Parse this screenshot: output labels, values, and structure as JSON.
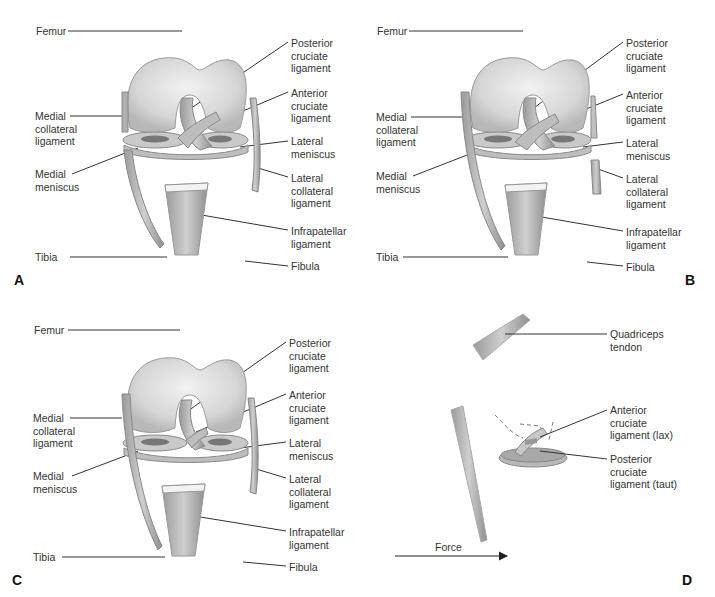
{
  "figure": {
    "panels": [
      {
        "id": "A",
        "letter": "A",
        "labels": {
          "femur": "Femur",
          "pcl": "Posterior\ncruciate\nligament",
          "acl": "Anterior\ncruciate\nligament",
          "mcl": "Medial\ncollateral\nligament",
          "lateral_meniscus": "Lateral\nmeniscus",
          "medial_meniscus": "Medial\nmeniscus",
          "lcl": "Lateral\ncollateral\nligament",
          "infrapatellar": "Infrapatellar\nligament",
          "tibia": "Tibia",
          "fibula": "Fibula"
        }
      },
      {
        "id": "B",
        "letter": "B",
        "labels": {
          "femur": "Femur",
          "pcl": "Posterior\ncruciate\nligament",
          "acl": "Anterior\ncruciate\nligament",
          "mcl": "Medial\ncollateral\nligament",
          "lateral_meniscus": "Lateral\nmeniscus",
          "medial_meniscus": "Medial\nmeniscus",
          "lcl": "Lateral\ncollateral\nligament",
          "infrapatellar": "Infrapatellar\nligament",
          "tibia": "Tibia",
          "fibula": "Fibula"
        }
      },
      {
        "id": "C",
        "letter": "C",
        "labels": {
          "femur": "Femur",
          "pcl": "Posterior\ncruciate\nligament",
          "acl": "Anterior\ncruciate\nligament",
          "mcl": "Medial\ncollateral\nligament",
          "lateral_meniscus": "Lateral\nmeniscus",
          "medial_meniscus": "Medial\nmeniscus",
          "lcl": "Lateral\ncollateral\nligament",
          "infrapatellar": "Infrapatellar\nligament",
          "tibia": "Tibia",
          "fibula": "Fibula"
        }
      },
      {
        "id": "D",
        "letter": "D",
        "labels": {
          "quadriceps": "Quadriceps\ntendon",
          "acl_lax": "Anterior\ncruciate\nligament (lax)",
          "pcl_taut": "Posterior\ncruciate\nligament (taut)",
          "force": "Force"
        }
      }
    ]
  }
}
